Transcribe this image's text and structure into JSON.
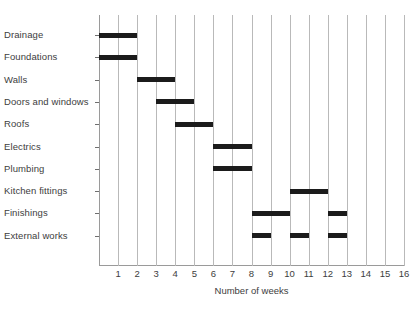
{
  "chart_data": {
    "type": "bar",
    "chart_style": "gantt",
    "title": "",
    "xlabel": "Number of weeks",
    "ylabel": "",
    "xlim": [
      0,
      16
    ],
    "ylim": [
      0,
      11
    ],
    "grid": true,
    "legend": false,
    "x_ticks": [
      1,
      2,
      3,
      4,
      5,
      6,
      7,
      8,
      9,
      10,
      11,
      12,
      13,
      14,
      15,
      16
    ],
    "bar_color": "#1b1b1b",
    "grid_color": "#b9b9b9",
    "axis_color": "#9a9a9a",
    "categories": [
      "Drainage",
      "Foundations",
      "Walls",
      "Doors and windows",
      "Roofs",
      "Electrics",
      "Plumbing",
      "Kitchen fittings",
      "Finishings",
      "External works"
    ],
    "tasks": [
      {
        "name": "Drainage",
        "segments": [
          {
            "start": 0,
            "end": 2
          }
        ]
      },
      {
        "name": "Foundations",
        "segments": [
          {
            "start": 0,
            "end": 2
          }
        ]
      },
      {
        "name": "Walls",
        "segments": [
          {
            "start": 2,
            "end": 4
          }
        ]
      },
      {
        "name": "Doors and windows",
        "segments": [
          {
            "start": 3,
            "end": 5
          }
        ]
      },
      {
        "name": "Roofs",
        "segments": [
          {
            "start": 4,
            "end": 6
          }
        ]
      },
      {
        "name": "Electrics",
        "segments": [
          {
            "start": 6,
            "end": 8
          }
        ]
      },
      {
        "name": "Plumbing",
        "segments": [
          {
            "start": 6,
            "end": 8
          }
        ]
      },
      {
        "name": "Kitchen fittings",
        "segments": [
          {
            "start": 10,
            "end": 12
          }
        ]
      },
      {
        "name": "Finishings",
        "segments": [
          {
            "start": 8,
            "end": 10
          },
          {
            "start": 12,
            "end": 13
          }
        ]
      },
      {
        "name": "External works",
        "segments": [
          {
            "start": 8,
            "end": 9
          },
          {
            "start": 10,
            "end": 11
          },
          {
            "start": 12,
            "end": 13
          }
        ]
      }
    ]
  }
}
